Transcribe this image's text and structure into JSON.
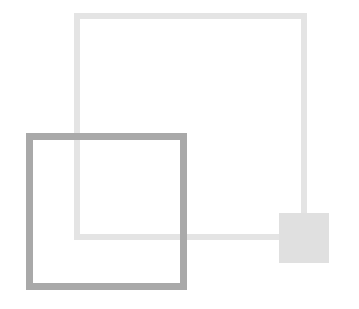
{
  "diagram": {
    "background": "#ffffff",
    "shapes": [
      {
        "id": "large-square",
        "kind": "outlined-square",
        "x": 74,
        "y": 13,
        "width": 233,
        "height": 227,
        "stroke_width": 6,
        "stroke_color": "#e4e4e4",
        "fill": "transparent"
      },
      {
        "id": "dark-square",
        "kind": "outlined-square",
        "x": 26,
        "y": 133,
        "width": 161,
        "height": 157,
        "stroke_width": 7,
        "stroke_color": "#a9a9a9",
        "fill": "transparent"
      },
      {
        "id": "small-square",
        "kind": "filled-square",
        "x": 279,
        "y": 213,
        "width": 50,
        "height": 50,
        "fill": "#e0e0e0"
      }
    ]
  }
}
